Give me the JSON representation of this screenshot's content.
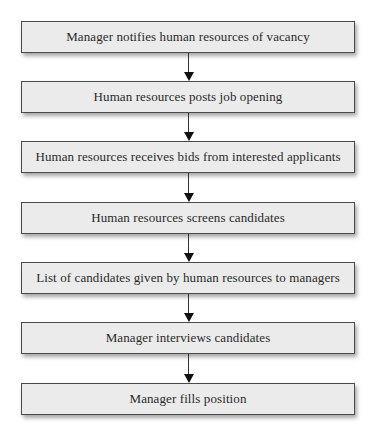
{
  "flowchart": {
    "steps": [
      {
        "label": "Manager notifies human resources of vacancy"
      },
      {
        "label": "Human resources posts job opening"
      },
      {
        "label": "Human resources receives bids from interested applicants"
      },
      {
        "label": "Human resources screens candidates"
      },
      {
        "label": "List of candidates given by human resources to managers"
      },
      {
        "label": "Manager interviews candidates"
      },
      {
        "label": "Manager fills position"
      }
    ],
    "connector_icon": "down-arrow-icon",
    "colors": {
      "box_fill": "#ebebeb",
      "box_border": "#4a4a4a",
      "arrow": "#111111"
    }
  }
}
